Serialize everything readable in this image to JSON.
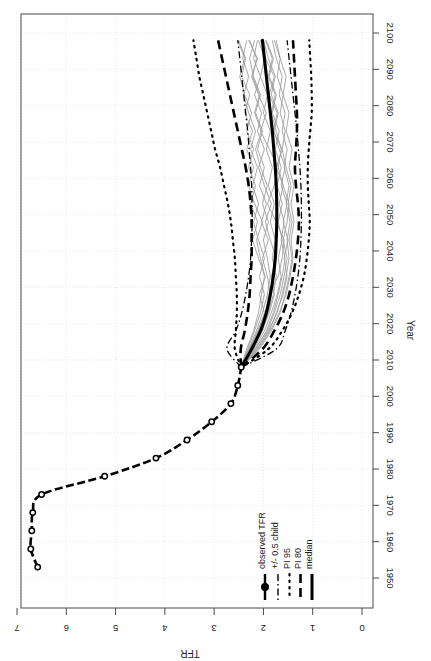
{
  "chart_data": {
    "type": "line",
    "title": "",
    "xlabel": "Year",
    "ylabel": "TFR",
    "orientation": "rotated-90-ccw",
    "xlim": [
      1950,
      2100
    ],
    "ylim": [
      0,
      7
    ],
    "xticks": [
      1950,
      1960,
      1970,
      1980,
      1990,
      2000,
      2010,
      2020,
      2030,
      2040,
      2050,
      2060,
      2070,
      2080,
      2090,
      2100
    ],
    "yticks": [
      0,
      1,
      2,
      3,
      4,
      5,
      6,
      7
    ],
    "grid": true,
    "legend_position": "bottom-right",
    "legend": [
      {
        "label": "median",
        "style": "solid",
        "width": 3.0
      },
      {
        "label": "PI 80",
        "style": "dashed",
        "width": 2.6
      },
      {
        "label": "PI 95",
        "style": "dotted",
        "width": 2.2
      },
      {
        "label": "+/- 0.5 child",
        "style": "dashdot",
        "width": 1.4
      },
      {
        "label": "observed TFR",
        "style": "solid-with-point",
        "width": 2.4
      }
    ],
    "series": [
      {
        "name": "observed TFR",
        "style": "solid-with-point",
        "x": [
          1953,
          1958,
          1963,
          1968,
          1973,
          1978,
          1983,
          1988,
          1993,
          1998,
          2003,
          2008
        ],
        "values": [
          6.58,
          6.72,
          6.7,
          6.68,
          6.5,
          5.22,
          4.18,
          3.55,
          3.05,
          2.66,
          2.52,
          2.45
        ]
      },
      {
        "name": "median",
        "style": "solid",
        "x": [
          2008,
          2013,
          2018,
          2023,
          2028,
          2033,
          2038,
          2043,
          2048,
          2053,
          2058,
          2063,
          2068,
          2073,
          2078,
          2083,
          2088,
          2093,
          2098
        ],
        "values": [
          2.45,
          2.24,
          2.06,
          1.94,
          1.86,
          1.8,
          1.76,
          1.74,
          1.73,
          1.73,
          1.74,
          1.76,
          1.79,
          1.82,
          1.86,
          1.9,
          1.94,
          1.98,
          2.02
        ]
      },
      {
        "name": "PI 80 lower",
        "style": "dashed",
        "x": [
          2008,
          2013,
          2018,
          2023,
          2028,
          2033,
          2038,
          2043,
          2048,
          2053,
          2058,
          2063,
          2068,
          2073,
          2078,
          2083,
          2088,
          2093,
          2098
        ],
        "values": [
          2.45,
          2.02,
          1.78,
          1.6,
          1.48,
          1.4,
          1.34,
          1.3,
          1.28,
          1.3,
          1.34,
          1.36,
          1.34,
          1.32,
          1.32,
          1.34,
          1.36,
          1.38,
          1.4
        ]
      },
      {
        "name": "PI 80 upper",
        "style": "dashed",
        "x": [
          2008,
          2013,
          2018,
          2023,
          2028,
          2033,
          2038,
          2043,
          2048,
          2053,
          2058,
          2063,
          2068,
          2073,
          2078,
          2083,
          2088,
          2093,
          2098
        ],
        "values": [
          2.45,
          2.46,
          2.38,
          2.32,
          2.28,
          2.26,
          2.24,
          2.24,
          2.24,
          2.26,
          2.3,
          2.36,
          2.44,
          2.52,
          2.6,
          2.68,
          2.76,
          2.84,
          2.92
        ]
      },
      {
        "name": "PI 95 lower",
        "style": "dotted",
        "x": [
          2008,
          2013,
          2018,
          2023,
          2028,
          2033,
          2038,
          2043,
          2048,
          2053,
          2058,
          2063,
          2068,
          2073,
          2078,
          2083,
          2088,
          2093,
          2098
        ],
        "values": [
          2.45,
          1.9,
          1.62,
          1.42,
          1.28,
          1.18,
          1.12,
          1.08,
          1.06,
          1.08,
          1.1,
          1.1,
          1.08,
          1.05,
          1.02,
          1.02,
          1.03,
          1.05,
          1.07
        ]
      },
      {
        "name": "PI 95 upper",
        "style": "dotted",
        "x": [
          2008,
          2013,
          2018,
          2023,
          2028,
          2033,
          2038,
          2043,
          2048,
          2053,
          2058,
          2063,
          2068,
          2073,
          2078,
          2083,
          2088,
          2093,
          2098
        ],
        "values": [
          2.45,
          2.58,
          2.56,
          2.54,
          2.54,
          2.56,
          2.58,
          2.62,
          2.66,
          2.72,
          2.8,
          2.88,
          2.98,
          3.06,
          3.14,
          3.22,
          3.3,
          3.36,
          3.42
        ]
      },
      {
        "name": "+/- 0.5 child lower",
        "style": "dashdot",
        "x": [
          2008,
          2013,
          2018,
          2023,
          2028,
          2033,
          2038,
          2043,
          2048,
          2053,
          2058,
          2063,
          2068,
          2073,
          2078,
          2083,
          2088,
          2093,
          2098
        ],
        "values": [
          2.45,
          1.74,
          1.56,
          1.44,
          1.36,
          1.3,
          1.26,
          1.24,
          1.23,
          1.23,
          1.24,
          1.26,
          1.29,
          1.32,
          1.36,
          1.4,
          1.44,
          1.48,
          1.52
        ]
      },
      {
        "name": "+/- 0.5 child upper",
        "style": "dashdot",
        "x": [
          2008,
          2013,
          2018,
          2023,
          2028,
          2033,
          2038,
          2043,
          2048,
          2053,
          2058,
          2063,
          2068,
          2073,
          2078,
          2083,
          2088,
          2093,
          2098
        ],
        "values": [
          2.45,
          2.74,
          2.56,
          2.44,
          2.36,
          2.3,
          2.26,
          2.24,
          2.23,
          2.23,
          2.24,
          2.26,
          2.29,
          2.32,
          2.36,
          2.4,
          2.44,
          2.48,
          2.52
        ]
      }
    ],
    "trajectories": [
      {
        "values": [
          2.45,
          2.28,
          2.12,
          1.96,
          1.9,
          1.7,
          1.62,
          1.58,
          1.74,
          1.92,
          1.78,
          1.7,
          1.88,
          2.06,
          1.94,
          2.1,
          2.24,
          2.12,
          2.3
        ]
      },
      {
        "values": [
          2.45,
          2.18,
          1.92,
          1.78,
          1.66,
          1.58,
          1.52,
          1.6,
          1.52,
          1.48,
          1.6,
          1.74,
          1.62,
          1.8,
          1.72,
          1.88,
          1.78,
          1.96,
          2.06
        ]
      },
      {
        "values": [
          2.45,
          2.34,
          2.2,
          2.1,
          2.04,
          1.98,
          2.06,
          2.14,
          2.02,
          2.18,
          2.3,
          2.2,
          2.34,
          2.22,
          2.38,
          2.28,
          2.44,
          2.36,
          2.5
        ]
      },
      {
        "values": [
          2.45,
          2.1,
          1.86,
          1.68,
          1.54,
          1.46,
          1.4,
          1.44,
          1.38,
          1.44,
          1.38,
          1.48,
          1.42,
          1.54,
          1.48,
          1.6,
          1.54,
          1.66,
          1.74
        ]
      },
      {
        "values": [
          2.45,
          2.26,
          2.04,
          1.88,
          1.78,
          1.84,
          1.74,
          1.86,
          1.96,
          1.84,
          1.98,
          2.1,
          1.98,
          2.12,
          2.04,
          2.18,
          2.06,
          2.2,
          2.12
        ]
      },
      {
        "values": [
          2.45,
          2.2,
          1.98,
          1.84,
          1.72,
          1.64,
          1.7,
          1.62,
          1.7,
          1.62,
          1.72,
          1.64,
          1.76,
          1.68,
          1.82,
          1.74,
          1.88,
          1.8,
          1.94
        ]
      },
      {
        "values": [
          2.45,
          2.3,
          2.14,
          2.02,
          1.92,
          1.86,
          1.92,
          2.0,
          1.9,
          2.02,
          1.92,
          2.06,
          2.16,
          2.04,
          2.18,
          2.08,
          2.22,
          2.14,
          2.28
        ]
      },
      {
        "values": [
          2.45,
          2.14,
          1.9,
          1.72,
          1.62,
          1.54,
          1.48,
          1.52,
          1.46,
          1.54,
          1.48,
          1.58,
          1.52,
          1.62,
          1.56,
          1.68,
          1.62,
          1.74,
          1.82
        ]
      },
      {
        "values": [
          2.45,
          2.24,
          2.08,
          1.94,
          1.86,
          1.92,
          2.02,
          1.9,
          2.04,
          1.94,
          2.08,
          1.98,
          2.12,
          2.02,
          2.16,
          2.06,
          2.2,
          2.28,
          2.18
        ]
      },
      {
        "values": [
          2.45,
          2.16,
          1.94,
          1.8,
          1.7,
          1.62,
          1.56,
          1.64,
          1.58,
          1.68,
          1.6,
          1.7,
          1.64,
          1.74,
          1.84,
          1.76,
          1.9,
          1.82,
          1.96
        ]
      },
      {
        "values": [
          2.45,
          2.32,
          2.18,
          2.06,
          1.98,
          2.08,
          1.98,
          2.1,
          2.2,
          2.1,
          2.22,
          2.12,
          2.26,
          2.16,
          2.3,
          2.4,
          2.3,
          2.42,
          2.34
        ]
      },
      {
        "values": [
          2.45,
          2.12,
          1.88,
          1.74,
          1.6,
          1.52,
          1.58,
          1.5,
          1.6,
          1.52,
          1.64,
          1.56,
          1.68,
          1.78,
          1.7,
          1.84,
          1.76,
          1.9,
          2.0
        ]
      },
      {
        "values": [
          2.45,
          2.22,
          2.02,
          1.9,
          1.8,
          1.74,
          1.82,
          1.76,
          1.86,
          1.78,
          1.9,
          1.82,
          1.94,
          1.86,
          2.0,
          1.92,
          2.06,
          1.98,
          2.1
        ]
      },
      {
        "values": [
          2.45,
          2.28,
          2.1,
          1.98,
          2.08,
          1.96,
          2.1,
          2.22,
          2.12,
          2.26,
          2.16,
          2.3,
          2.2,
          2.34,
          2.24,
          2.38,
          2.48,
          2.38,
          2.52
        ]
      },
      {
        "values": [
          2.45,
          2.08,
          1.84,
          1.66,
          1.56,
          1.48,
          1.42,
          1.48,
          1.42,
          1.5,
          1.44,
          1.54,
          1.62,
          1.56,
          1.66,
          1.6,
          1.72,
          1.66,
          1.78
        ]
      }
    ]
  },
  "axes": {
    "xlabel": "Year",
    "ylabel": "TFR",
    "xtick_labels": [
      "1950",
      "1960",
      "1970",
      "1980",
      "1990",
      "2000",
      "2010",
      "2020",
      "2030",
      "2040",
      "2050",
      "2060",
      "2070",
      "2080",
      "2090",
      "2100"
    ],
    "ytick_labels": [
      "0",
      "1",
      "2",
      "3",
      "4",
      "5",
      "6",
      "7"
    ]
  },
  "legend": {
    "items": [
      "median",
      "PI 80",
      "PI 95",
      "+/- 0.5 child",
      "observed TFR"
    ]
  },
  "colors": {
    "line": "#000000",
    "trajectory": "#9a9a9a",
    "grid": "#e3e3e3",
    "axis": "#4a4a4a",
    "background": "#ffffff"
  }
}
